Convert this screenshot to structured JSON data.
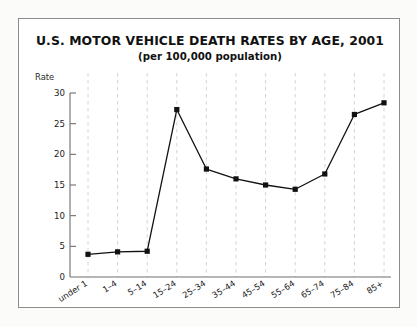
{
  "figure": {
    "title": "U.S. MOTOR VEHICLE DEATH RATES BY AGE, 2001",
    "subtitle": "(per 100,000 population)",
    "y_axis_caption": "Rate"
  },
  "chart_data": {
    "type": "line",
    "title": "U.S. MOTOR VEHICLE DEATH RATES BY AGE, 2001",
    "subtitle": "(per 100,000 population)",
    "xlabel": "",
    "ylabel": "Rate",
    "categories": [
      "under 1",
      "1–4",
      "5–14",
      "15–24",
      "25–34",
      "35–44",
      "45–54",
      "55–64",
      "65–74",
      "75–84",
      "85+"
    ],
    "values": [
      3.7,
      4.1,
      4.2,
      27.3,
      17.6,
      16.0,
      15.0,
      14.3,
      16.8,
      26.5,
      28.4
    ],
    "ylim": [
      0,
      30
    ],
    "yticks": [
      0,
      5,
      10,
      15,
      20,
      25,
      30
    ],
    "ytick_labels": [
      "0",
      "5",
      "10",
      "15",
      "20",
      "25",
      "30"
    ],
    "grid": "vertical-dashed",
    "legend": "none",
    "marker": "square",
    "series_color": "#111111",
    "grid_color": "#cfcfcf",
    "axis_color": "#6e6e6e",
    "xtick_rotation_deg": -32
  }
}
